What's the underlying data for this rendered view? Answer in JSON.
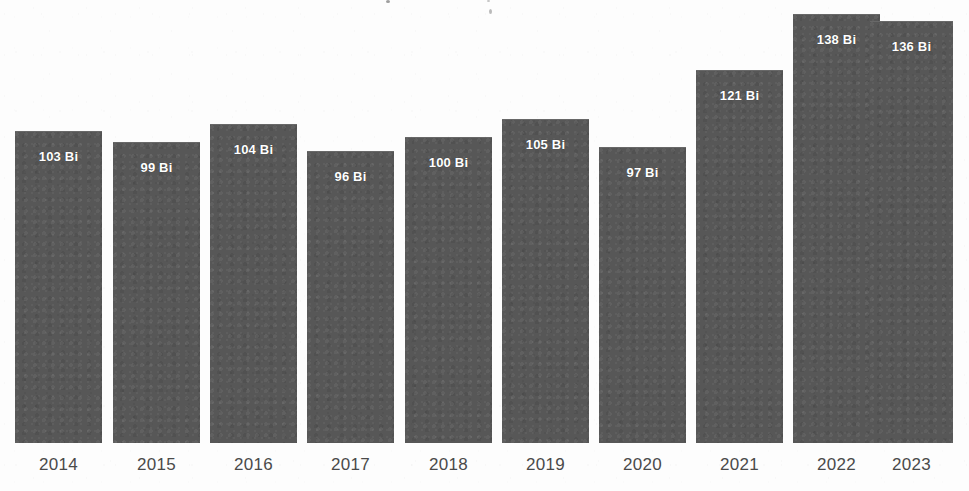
{
  "chart_data": {
    "type": "bar",
    "title": "",
    "xlabel": "",
    "ylabel": "",
    "unit": "Bi",
    "grid": false,
    "legend": false,
    "axis_line": false,
    "ylim": [
      88,
      142
    ],
    "categories": [
      "2014",
      "2015",
      "2016",
      "2017",
      "2018",
      "2019",
      "2020",
      "2021",
      "2022",
      "2023"
    ],
    "values": [
      103,
      99,
      104,
      96,
      100,
      105,
      97,
      121,
      138,
      136
    ],
    "value_labels": [
      "103 Bi",
      "99 Bi",
      "104 Bi",
      "96 Bi",
      "100 Bi",
      "105 Bi",
      "97 Bi",
      "121 Bi",
      "138 Bi",
      "136 Bi"
    ],
    "bars": [
      {
        "category": "2014",
        "value": 103,
        "label": "103 Bi",
        "x": 15,
        "width": 87,
        "top": 131
      },
      {
        "category": "2015",
        "value": 99,
        "label": "99 Bi",
        "x": 113,
        "width": 87,
        "top": 142
      },
      {
        "category": "2016",
        "value": 104,
        "label": "104 Bi",
        "x": 210,
        "width": 87,
        "top": 124
      },
      {
        "category": "2017",
        "value": 96,
        "label": "96 Bi",
        "x": 307,
        "width": 87,
        "top": 151
      },
      {
        "category": "2018",
        "value": 100,
        "label": "100 Bi",
        "x": 405,
        "width": 87,
        "top": 137
      },
      {
        "category": "2019",
        "value": 105,
        "label": "105 Bi",
        "x": 502,
        "width": 87,
        "top": 119
      },
      {
        "category": "2020",
        "value": 97,
        "label": "97 Bi",
        "x": 599,
        "width": 87,
        "top": 147
      },
      {
        "category": "2021",
        "value": 121,
        "label": "121 Bi",
        "x": 696,
        "width": 87,
        "top": 70
      },
      {
        "category": "2022",
        "value": 138,
        "label": "138 Bi",
        "x": 793,
        "width": 87,
        "top": 14
      },
      {
        "category": "2023",
        "value": 136,
        "label": "136 Bi",
        "x": 870,
        "width": 83,
        "top": 21
      }
    ],
    "colors": {
      "bar": "#575757",
      "value_label": "#ffffff",
      "tick_label": "#4a4a4a",
      "background": "#fdfdfd"
    }
  }
}
